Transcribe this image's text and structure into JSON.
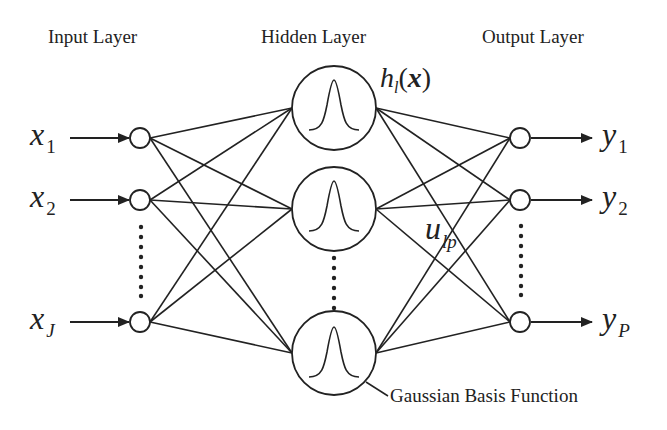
{
  "diagram": {
    "layers": [
      {
        "id": "input",
        "label": "Input Layer"
      },
      {
        "id": "hidden",
        "label": "Hidden Layer"
      },
      {
        "id": "output",
        "label": "Output Layer"
      }
    ],
    "inputs": [
      {
        "symbol": "x",
        "sub": "1"
      },
      {
        "symbol": "x",
        "sub": "2"
      },
      {
        "symbol": "x",
        "sub": "J"
      }
    ],
    "outputs": [
      {
        "symbol": "y",
        "sub": "1"
      },
      {
        "symbol": "y",
        "sub": "2"
      },
      {
        "symbol": "y",
        "sub": "P"
      }
    ],
    "hidden_label": {
      "h": "h",
      "sub": "l",
      "open": "(",
      "arg": "x",
      "close": ")"
    },
    "weight_label": {
      "symbol": "u",
      "sub": "lp"
    },
    "annotation": "Gaussian Basis Function",
    "colors": {
      "stroke": "#222222",
      "background": "#ffffff"
    }
  }
}
